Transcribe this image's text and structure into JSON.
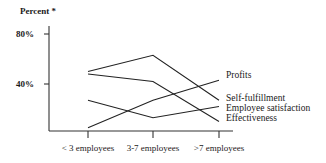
{
  "chart_data": {
    "type": "line",
    "title": "",
    "ylabel": "Percent *",
    "xlabel": "",
    "categories": [
      "< 3 employees",
      "3-7 employees",
      ">7 employees"
    ],
    "ylim": [
      0,
      80
    ],
    "yticks": [
      {
        "value": 80,
        "label": "80%"
      },
      {
        "value": 40,
        "label": "40%"
      }
    ],
    "grid": false,
    "legend_placement": "right (labels at line ends)",
    "series": [
      {
        "name": "Profits",
        "values": [
          5,
          27,
          43
        ]
      },
      {
        "name": "Self-fulfillment",
        "values": [
          50,
          63,
          27
        ]
      },
      {
        "name": "Employee satisfaction",
        "values": [
          27,
          13,
          22
        ]
      },
      {
        "name": "Effectiveness",
        "values": [
          48,
          42,
          10
        ]
      }
    ]
  }
}
